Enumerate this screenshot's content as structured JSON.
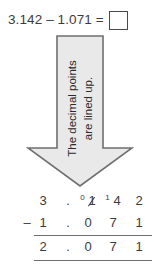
{
  "equation": {
    "text": "3.142 – 1.071 =",
    "answer_box_value": ""
  },
  "callout": {
    "line1": "The decimal points",
    "line2": "are lined up.",
    "direction": "down",
    "fill_color": "#e9e9e9",
    "border_color": "#6f6f6f"
  },
  "subtraction": {
    "minuend": {
      "whole": "3",
      "point": ".",
      "tenths_carry": "0",
      "tenths_struck": "1",
      "hundredths_carry": "1",
      "hundredths": "4",
      "thousandths": "2"
    },
    "operator": "–",
    "subtrahend": {
      "whole": "1",
      "point": ".",
      "tenths": "0",
      "hundredths": "7",
      "thousandths": "1"
    },
    "difference": {
      "whole": "2",
      "point": ".",
      "tenths": "0",
      "hundredths": "7",
      "thousandths": "1"
    }
  }
}
